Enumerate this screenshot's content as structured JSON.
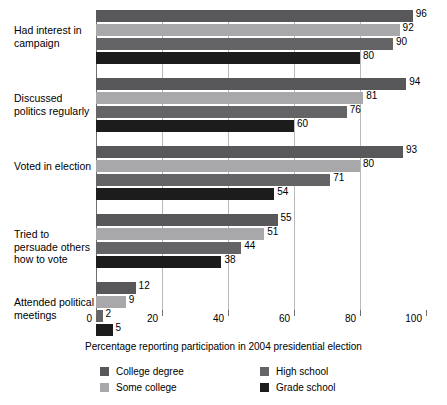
{
  "chart_data": {
    "type": "bar",
    "orientation": "horizontal",
    "title": "",
    "xlabel": "Percentage reporting participation in 2004 presidential election",
    "ylabel": "",
    "xlim": [
      0,
      100
    ],
    "xticks": [
      0,
      20,
      40,
      60,
      80,
      100
    ],
    "xtick_labels": [
      "0",
      "20",
      "40",
      "60",
      "80",
      "100"
    ],
    "grid": true,
    "gridlines_at": [
      20,
      40,
      60,
      80
    ],
    "legend_position": "bottom",
    "categories": [
      "Had interest in campaign",
      "Discussed politics regularly",
      "Voted in election",
      "Tried to persuade others how to vote",
      "Attended political meetings"
    ],
    "series": [
      {
        "name": "College degree",
        "color": "#58585a",
        "values": [
          96,
          94,
          93,
          55,
          12
        ]
      },
      {
        "name": "Some college",
        "color": "#a8a8aa",
        "values": [
          92,
          81,
          80,
          51,
          9
        ]
      },
      {
        "name": "High school",
        "color": "#646466",
        "values": [
          90,
          76,
          71,
          44,
          2
        ]
      },
      {
        "name": "Grade school",
        "color": "#1c1c1c",
        "values": [
          80,
          60,
          54,
          38,
          5
        ]
      }
    ]
  },
  "axis": {
    "x_title": "Percentage reporting participation in 2004 presidential election",
    "ticks": [
      "0",
      "20",
      "40",
      "60",
      "80",
      "100"
    ]
  },
  "categories": [
    {
      "label": "Had interest in campaign"
    },
    {
      "label": "Discussed politics regularly"
    },
    {
      "label": "Voted in election"
    },
    {
      "label": "Tried to persuade others how to vote"
    },
    {
      "label": "Attended political meetings"
    }
  ],
  "legend": {
    "items": [
      {
        "label": "College degree",
        "color": "#58585a"
      },
      {
        "label": "High school",
        "color": "#646466"
      },
      {
        "label": "Some college",
        "color": "#a8a8aa"
      },
      {
        "label": "Grade school",
        "color": "#1c1c1c"
      }
    ]
  }
}
